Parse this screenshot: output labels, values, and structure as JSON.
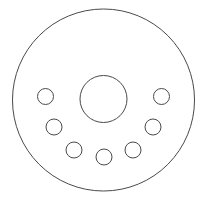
{
  "document": {
    "title": "Brake Disc",
    "subject": "brake-disc-rotor-face-view",
    "view": "front elevation",
    "style": "technical line drawing",
    "background_color": "#ffffff"
  },
  "canvas": {
    "width": 204,
    "height": 200
  },
  "stroke": {
    "color": "#4a4a4a",
    "outer_width": 1,
    "hub_width": 1,
    "hole_width": 1,
    "fill": "none"
  },
  "geometry": {
    "center": {
      "x": 103.5,
      "y": 100
    },
    "outer_disc": {
      "name": "disc-outer-edge",
      "cx": 103.5,
      "cy": 100,
      "r": 91
    },
    "hub_bore": {
      "name": "hub-center-bore",
      "cx": 103.5,
      "cy": 99,
      "r": 23.5
    },
    "bolt_circle": {
      "name": "bolt-hole-pattern",
      "count": 7,
      "pitch_radius": 59,
      "hole_radius": 8,
      "arc_start_deg": 180,
      "arc_end_deg": 0,
      "step_deg": 30
    }
  },
  "bolt_holes": [
    {
      "id": "bolt-hole-1",
      "position": "left",
      "cx": 45.5,
      "cy": 96.5,
      "r": 8,
      "angle_deg": 180
    },
    {
      "id": "bolt-hole-2",
      "position": "lower-left",
      "cx": 54.0,
      "cy": 127.0,
      "r": 8,
      "angle_deg": 150
    },
    {
      "id": "bolt-hole-3",
      "position": "bottom-left",
      "cx": 74.0,
      "cy": 150.0,
      "r": 8,
      "angle_deg": 120
    },
    {
      "id": "bolt-hole-4",
      "position": "bottom",
      "cx": 104.0,
      "cy": 157.0,
      "r": 8,
      "angle_deg": 90
    },
    {
      "id": "bolt-hole-5",
      "position": "bottom-right",
      "cx": 133.0,
      "cy": 150.0,
      "r": 8,
      "angle_deg": 60
    },
    {
      "id": "bolt-hole-6",
      "position": "lower-right",
      "cx": 153.0,
      "cy": 127.0,
      "r": 8,
      "angle_deg": 30
    },
    {
      "id": "bolt-hole-7",
      "position": "right",
      "cx": 161.5,
      "cy": 96.5,
      "r": 8,
      "angle_deg": 0
    }
  ]
}
